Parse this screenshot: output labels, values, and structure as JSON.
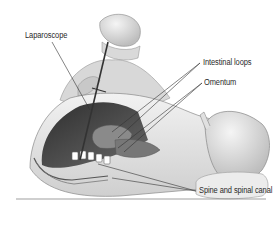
{
  "figure": {
    "labels": [
      {
        "id": "laparoscope",
        "text": "Laparoscope"
      },
      {
        "id": "intestinal-loops",
        "text": "Intestinal loops"
      },
      {
        "id": "omentum",
        "text": "Omentum"
      },
      {
        "id": "spine",
        "text": "Spine and spinal canal"
      }
    ]
  },
  "colors": {
    "background": "#ffffff",
    "line": "#333333",
    "skin": "#e6e6e6",
    "cavity": "#4a4a4a",
    "label": "#2a2a2a"
  }
}
